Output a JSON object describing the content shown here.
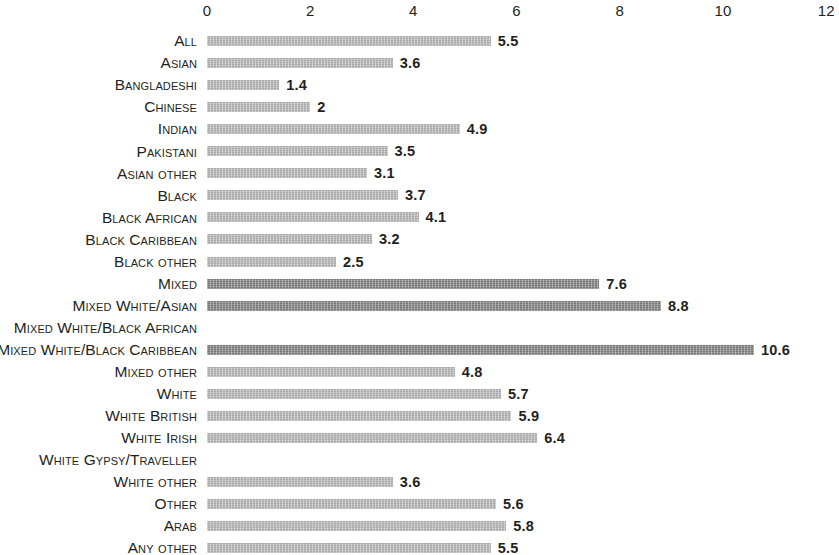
{
  "chart_data": {
    "type": "bar",
    "orientation": "horizontal",
    "title": "",
    "subtitle": "",
    "xlabel": "",
    "ylabel": "",
    "xlim": [
      0,
      12
    ],
    "x_ticks": [
      0,
      2,
      4,
      6,
      8,
      10,
      12
    ],
    "x_tick_labels": [
      "0",
      "2",
      "4",
      "6",
      "8",
      "10",
      "12"
    ],
    "grid": false,
    "legend": null,
    "categories": [
      "All",
      "Asian",
      "Bangladeshi",
      "Chinese",
      "Indian",
      "Pakistani",
      "Asian other",
      "Black",
      "Black African",
      "Black Caribbean",
      "Black other",
      "Mixed",
      "Mixed White/Asian",
      "Mixed White/Black African",
      "Mixed White/Black Caribbean",
      "Mixed other",
      "White",
      "White British",
      "White Irish",
      "White Gypsy/Traveller",
      "White other",
      "Other",
      "Arab",
      "Any other"
    ],
    "values": [
      5.5,
      3.6,
      1.4,
      2,
      4.9,
      3.5,
      3.1,
      3.7,
      4.1,
      3.2,
      2.5,
      7.6,
      8.8,
      null,
      10.6,
      4.8,
      5.7,
      5.9,
      6.4,
      null,
      3.6,
      5.6,
      5.8,
      5.5
    ],
    "value_labels": [
      "5.5",
      "3.6",
      "1.4",
      "2",
      "4.9",
      "3.5",
      "3.1",
      "3.7",
      "4.1",
      "3.2",
      "2.5",
      "7.6",
      "8.8",
      "",
      "10.6",
      "4.8",
      "5.7",
      "5.9",
      "6.4",
      "",
      "3.6",
      "5.6",
      "5.8",
      "5.5"
    ],
    "bar_styles": [
      "light",
      "light",
      "light",
      "light",
      "light",
      "light",
      "light",
      "light",
      "light",
      "light",
      "light",
      "dark",
      "dark",
      "none",
      "dark",
      "light",
      "light",
      "light",
      "light",
      "none",
      "light",
      "light",
      "light",
      "light"
    ],
    "colors": {
      "bar_light": "#b5b5b5",
      "bar_dark": "#7e7e7e",
      "text": "#231f20",
      "background": "#ffffff"
    }
  }
}
